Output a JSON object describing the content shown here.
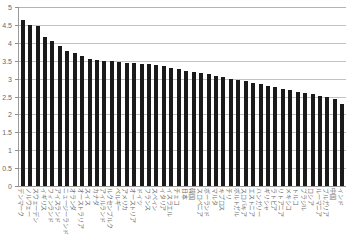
{
  "chart": {
    "title": "",
    "title_faint_strip": "",
    "axis": {
      "y_ticks": [
        "0",
        "0.5",
        "1",
        "1.5",
        "2",
        "2.5",
        "3",
        "3.5",
        "4",
        "4.5",
        "5"
      ]
    }
  },
  "chart_data": {
    "type": "bar",
    "title": "",
    "subtitle": "",
    "xlabel": "",
    "ylabel": "",
    "ylim": [
      0,
      5
    ],
    "ytick_interval": 0.5,
    "grid": true,
    "legend": false,
    "orientation": "vertical",
    "bar_color": "#1a1a1a",
    "categories": [
      "デンマーク",
      "ノルウェー",
      "スウェーデン",
      "イギリス",
      "フィンランド",
      "アイスランド",
      "ニュージーランド",
      "オランダ",
      "オーストラリア",
      "スイス",
      "カナダ",
      "アイルランド",
      "ルクセンブルク",
      "ベルギー",
      "アメリカ",
      "オーストリア",
      "ドイツ",
      "フランス",
      "スペイン",
      "イタリア",
      "イスラエル",
      "チェコ",
      "日本",
      "韓国",
      "スロベニア",
      "ポーランド",
      "マルタ",
      "キプロス",
      "チリ",
      "ポルトガル",
      "スロバキア",
      "エストニア",
      "ハンガリー",
      "ギリシャ",
      "ラトビア",
      "リトアニア",
      "メキシコ",
      "トルコ",
      "ブラジル",
      "ロシア",
      "ルーマニア",
      "ブルガリア",
      "中国",
      "インド"
    ],
    "values": [
      4.65,
      4.5,
      4.47,
      4.16,
      4.05,
      3.9,
      3.78,
      3.72,
      3.62,
      3.55,
      3.52,
      3.5,
      3.48,
      3.46,
      3.45,
      3.44,
      3.42,
      3.4,
      3.38,
      3.34,
      3.3,
      3.26,
      3.22,
      3.18,
      3.15,
      3.12,
      3.08,
      3.04,
      3.0,
      2.96,
      2.92,
      2.88,
      2.84,
      2.8,
      2.76,
      2.72,
      2.68,
      2.64,
      2.6,
      2.56,
      2.52,
      2.48,
      2.42,
      2.3
    ]
  }
}
